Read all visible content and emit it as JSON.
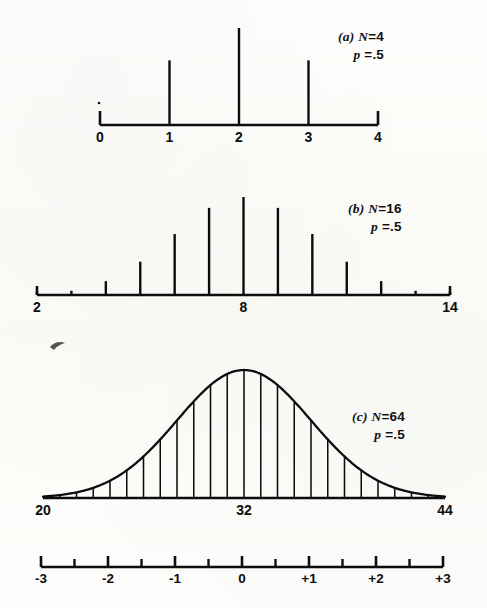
{
  "figure": {
    "background_color": "#fdfdfb",
    "ink_color": "#0d0d0d",
    "width": 487,
    "height": 608
  },
  "panels": [
    {
      "id": "panel-a",
      "letter": "(a)",
      "n_label": "N",
      "n_equals": "=",
      "n_value": "4",
      "p_label": "p",
      "p_equals": "=",
      "p_value": ".5",
      "axis_ticks": [
        "0",
        "1",
        "2",
        "3",
        "4"
      ],
      "axis_min": 0,
      "axis_max": 4
    },
    {
      "id": "panel-b",
      "letter": "(b)",
      "n_label": "N",
      "n_equals": "=",
      "n_value": "16",
      "p_label": "p",
      "p_equals": "=",
      "p_value": ".5",
      "axis_ticks": [
        "2",
        "8",
        "14"
      ],
      "axis_min": 2,
      "axis_max": 14
    },
    {
      "id": "panel-c",
      "letter": "(c)",
      "n_label": "N",
      "n_equals": "=",
      "n_value": "64",
      "p_label": "p",
      "p_equals": "=",
      "p_value": ".5",
      "axis_ticks": [
        "20",
        "32",
        "44"
      ],
      "axis_min": 20,
      "axis_max": 44
    }
  ],
  "z_axis": {
    "id": "z-score-axis",
    "labels": [
      "-3",
      "-2",
      "-1",
      "0",
      "+1",
      "+2",
      "+3"
    ],
    "values": [
      -3,
      -2,
      -1,
      0,
      1,
      2,
      3
    ],
    "minor_step": 0.5,
    "axis_min": -3,
    "axis_max": 3
  },
  "chart_data": [
    {
      "type": "bar",
      "id": "panel-a-binomial",
      "title": "(a) N = 4, p = .5",
      "subtitle": "Binomial probability distribution, N = 4",
      "xlabel": "",
      "ylabel": "",
      "categories": [
        "0",
        "1",
        "2",
        "3",
        "4"
      ],
      "x": [
        0,
        1,
        2,
        3,
        4
      ],
      "values": [
        0.0625,
        0.25,
        0.375,
        0.25,
        0.0625
      ],
      "values_as_sixteenths": [
        1,
        4,
        6,
        4,
        1
      ],
      "xlim": [
        0,
        4
      ],
      "ylim": [
        0,
        0.375
      ],
      "grid": false,
      "legend": false,
      "axis_tick_labels": [
        "0",
        "1",
        "2",
        "3",
        "4"
      ],
      "notes": "Spikes drawn at 1, 2, 3; values at 0 and 4 are too small to render as visible spikes."
    },
    {
      "type": "bar",
      "id": "panel-b-binomial",
      "title": "(b) N = 16, p = .5",
      "subtitle": "Binomial probability distribution, N = 16",
      "xlabel": "",
      "ylabel": "",
      "categories": [
        "2",
        "3",
        "4",
        "5",
        "6",
        "7",
        "8",
        "9",
        "10",
        "11",
        "12",
        "13",
        "14"
      ],
      "x": [
        2,
        3,
        4,
        5,
        6,
        7,
        8,
        9,
        10,
        11,
        12,
        13,
        14
      ],
      "values": [
        0.0018,
        0.0085,
        0.0278,
        0.0667,
        0.1222,
        0.1746,
        0.1964,
        0.1746,
        0.1222,
        0.0667,
        0.0278,
        0.0085,
        0.0018
      ],
      "xlim": [
        2,
        14
      ],
      "ylim": [
        0,
        0.1964
      ],
      "grid": false,
      "legend": false,
      "axis_tick_labels": [
        "2",
        "8",
        "14"
      ],
      "notes": "Symmetric about 8; tails at 2 and 14 appear as tiny dots on the axis."
    },
    {
      "type": "area",
      "id": "panel-c-normal",
      "title": "(c) N = 64, p = .5",
      "subtitle": "Binomial distribution N = 64 approximated by the normal curve, mean 32, sd 4",
      "xlabel": "",
      "ylabel": "",
      "mean": 32,
      "sd": 4,
      "xlim": [
        20,
        44
      ],
      "ylim": [
        0,
        1
      ],
      "grid": false,
      "legend": false,
      "axis_tick_labels": [
        "20",
        "32",
        "44"
      ],
      "ordinate_x": [
        20,
        21,
        22,
        23,
        24,
        25,
        26,
        27,
        28,
        29,
        30,
        31,
        32,
        33,
        34,
        35,
        36,
        37,
        38,
        39,
        40,
        41,
        42,
        43,
        44
      ],
      "ordinate_heights": [
        0.0111,
        0.0228,
        0.0439,
        0.0796,
        0.1353,
        0.2163,
        0.3247,
        0.4578,
        0.6065,
        0.7548,
        0.8825,
        0.9692,
        1.0,
        0.9692,
        0.8825,
        0.7548,
        0.6065,
        0.4578,
        0.3247,
        0.2163,
        0.1353,
        0.0796,
        0.0439,
        0.0228,
        0.0111
      ],
      "notes": "Smooth normal curve with 25 vertical ordinate lines at unit intervals from 20 to 44."
    },
    {
      "type": "line",
      "id": "z-score-scale",
      "title": "Standard score (z) scale",
      "xlabel": "",
      "ylabel": "",
      "x": [
        -3,
        -2.5,
        -2,
        -1.5,
        -1,
        -0.5,
        0,
        0.5,
        1,
        1.5,
        2,
        2.5,
        3
      ],
      "major_ticks": [
        -3,
        -2,
        -1,
        0,
        1,
        2,
        3
      ],
      "major_tick_labels": [
        "-3",
        "-2",
        "-1",
        "0",
        "+1",
        "+2",
        "+3"
      ],
      "minor_ticks": [
        -2.5,
        -1.5,
        -0.5,
        0.5,
        1.5,
        2.5
      ],
      "xlim": [
        -3,
        3
      ],
      "grid": false,
      "legend": false,
      "notes": "Aligned under panel (c): z = -3 at raw 20, z = 0 at raw 32, z = +3 at raw 44."
    }
  ]
}
